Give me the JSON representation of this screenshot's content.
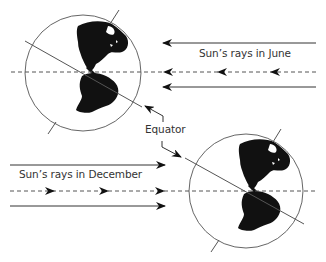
{
  "diagram": {
    "title": "",
    "labels": {
      "june_rays": "Sun’s rays in June",
      "december_rays": "Sun’s rays in December",
      "equator": "Equator"
    },
    "globes": [
      {
        "name": "june-globe",
        "center": [
          83,
          73
        ],
        "radius": 58,
        "axis_tilt_deg": 23.5,
        "rays_direction": "right-to-left"
      },
      {
        "name": "december-globe",
        "center": [
          246,
          191
        ],
        "radius": 57,
        "axis_tilt_deg": 23.5,
        "rays_direction": "left-to-right"
      }
    ],
    "colors": {
      "line": "#555555",
      "land": "#111111",
      "arrow": "#111111",
      "background": "#ffffff"
    }
  }
}
